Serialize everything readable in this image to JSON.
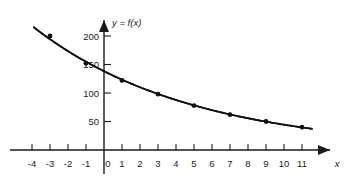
{
  "figure": {
    "background_color": "#ffffff",
    "ink_color": "#111111"
  },
  "labels": {
    "y_axis_name": "y = f(x)",
    "x_axis_name": "x"
  },
  "chart_data": {
    "type": "line",
    "title": "",
    "subtitle": "",
    "xlabel": "x",
    "ylabel": "y = f(x)",
    "grid": false,
    "legend": "none",
    "xlim": [
      -4.6,
      12.2
    ],
    "ylim": [
      0,
      225
    ],
    "x_ticks": [
      -4,
      -3,
      -2,
      -1,
      0,
      1,
      2,
      3,
      4,
      5,
      6,
      7,
      8,
      9,
      10,
      11
    ],
    "x_tick_labels": [
      "-4",
      "-3",
      "-2",
      "-1",
      "0",
      "1",
      "2",
      "3",
      "4",
      "5",
      "6",
      "7",
      "8",
      "9",
      "10",
      "11"
    ],
    "y_ticks": [
      50,
      100,
      150,
      200
    ],
    "y_tick_labels": [
      "50",
      "100",
      "150",
      "200"
    ],
    "axes_have_arrows": true,
    "series": [
      {
        "name": "f(x)",
        "curve_style": "smooth-decaying",
        "x": [
          -3,
          -1,
          1,
          3,
          5,
          7,
          9,
          11
        ],
        "values": [
          200,
          152,
          122,
          98,
          78,
          62,
          50,
          40
        ],
        "marker": "filled-circle",
        "curve_start": {
          "x": -3.9,
          "y": 222
        },
        "curve_end": {
          "x": 11.55,
          "y": 38
        },
        "y_intercept": 132
      }
    ]
  }
}
